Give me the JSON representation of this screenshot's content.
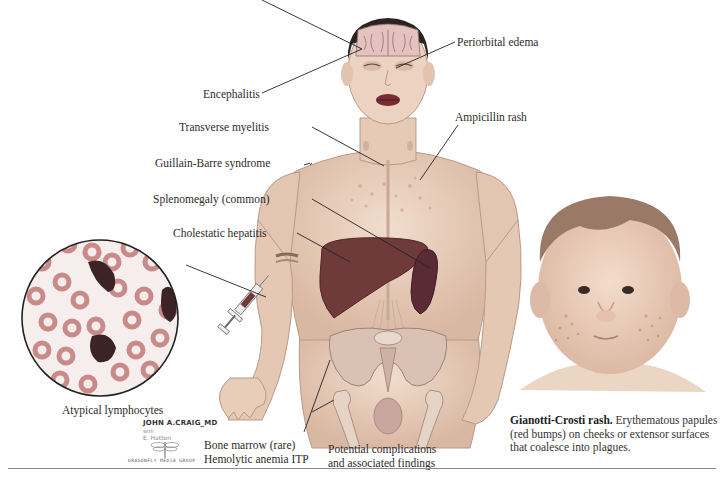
{
  "figure": {
    "labels": {
      "encephalitis": "Encephalitis",
      "periorbital_edema": "Periorbital edema",
      "ampicillin_rash": "Ampicillin rash",
      "transverse_myelitis": "Transverse myelitis",
      "guillain_barre": "Guillain-Barre syndrome",
      "splenomegaly": "Splenomegaly (common)",
      "cholestatic_hepatitis": "Cholestatic hepatitis",
      "atypical_lymphocytes": "Atypical lymphocytes",
      "bone_marrow_line1": "Bone marrow (rare)",
      "bone_marrow_line2": "Hemolytic anemia ITP",
      "summary_line1": "Potential complications",
      "summary_line2": "and associated findings"
    },
    "caption": {
      "bold": "Gianotti-Crosti rash.",
      "line1_rest": " Erythematous papules",
      "line2": "(red bumps) on cheeks or extensor surfaces",
      "line3": "that coalesce into plagues."
    },
    "credits": {
      "artist": "JOHN A.CRAIG_MD",
      "with": "with",
      "coartist": "E. Hatton",
      "publisher": "DRAGONFLY MEDIA GROUP"
    },
    "colors": {
      "skin": "#e9d2c0",
      "skin_shadow": "#cfae98",
      "liver": "#6e3b3a",
      "spleen": "#5a2b35",
      "rbc": "#c98a8a",
      "lymphocyte": "#3b2326",
      "line": "#222222",
      "rule": "#8a8a8a"
    }
  }
}
